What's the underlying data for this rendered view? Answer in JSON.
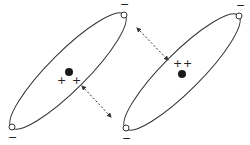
{
  "diagram": {
    "type": "dipole-interaction",
    "colors": {
      "stroke": "#333333",
      "background": "#ffffff",
      "dot": "#1a1a1a"
    },
    "molecules": [
      {
        "id": "left",
        "ellipse": {
          "cx": 68,
          "cy": 71,
          "rx": 80,
          "ry": 19,
          "rotate": -45
        },
        "nucleus": {
          "cx": 69,
          "cy": 72,
          "r": 4
        },
        "plus_signs": [
          {
            "x": 61,
            "y": 81,
            "label": "+"
          },
          {
            "x": 76,
            "y": 81,
            "label": "+"
          }
        ],
        "end_circles": [
          {
            "cx": 12,
            "cy": 127
          },
          {
            "cx": 124,
            "cy": 15
          }
        ],
        "minus_signs": [
          {
            "x": 12,
            "y": 137,
            "label": "−"
          },
          {
            "x": 124,
            "y": 4,
            "label": "−"
          }
        ]
      },
      {
        "id": "right",
        "ellipse": {
          "cx": 182,
          "cy": 72,
          "rx": 80,
          "ry": 19,
          "rotate": -45
        },
        "nucleus": {
          "cx": 182,
          "cy": 74,
          "r": 4
        },
        "plus_signs": [
          {
            "x": 177,
            "y": 64,
            "label": "+"
          },
          {
            "x": 187,
            "y": 64,
            "label": "+"
          }
        ],
        "end_circles": [
          {
            "cx": 126,
            "cy": 128
          },
          {
            "cx": 239,
            "cy": 16
          }
        ],
        "minus_signs": [
          {
            "x": 126,
            "y": 138,
            "label": "−"
          },
          {
            "x": 240,
            "y": 5,
            "label": "−"
          }
        ]
      }
    ],
    "arrows": [
      {
        "id": "arrow-lower",
        "x1": 82,
        "y1": 86,
        "x2": 111,
        "y2": 117,
        "style": "dashed",
        "heads": "both"
      },
      {
        "id": "arrow-upper",
        "x1": 137,
        "y1": 28,
        "x2": 168,
        "y2": 60,
        "style": "dashed",
        "heads": "both"
      }
    ]
  },
  "labels": {
    "plus": "+",
    "minus": "−"
  }
}
